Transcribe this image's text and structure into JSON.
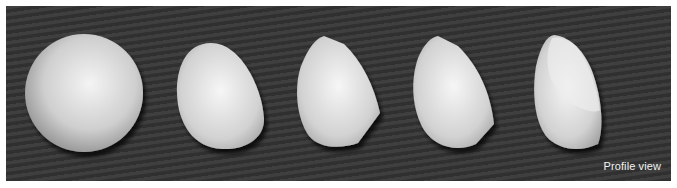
{
  "figure": {
    "background_color": "#353535",
    "shape_color": "#d8d8d8",
    "shapes": [
      {
        "name": "sphere"
      },
      {
        "name": "egg"
      },
      {
        "name": "faceted-egg"
      },
      {
        "name": "cut-egg"
      },
      {
        "name": "half-cut-egg"
      }
    ],
    "label": "Profile view"
  }
}
